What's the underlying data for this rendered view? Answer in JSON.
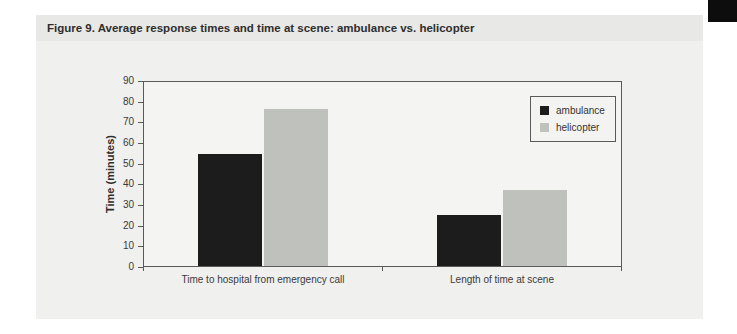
{
  "figure_title": "Figure 9. Average response times and time at scene: ambulance vs. helicopter",
  "decorations": {
    "corner_block_color": "#0d0d0d",
    "title_band_color": "#e8e8e6",
    "panel_color": "#f0f0ee",
    "plot_background_color": "#f4f4f2",
    "axis_line_color": "#5a5a5a"
  },
  "chart_data": {
    "type": "bar",
    "categories": [
      "Time to hospital from emergency call",
      "Length of time at scene"
    ],
    "series": [
      {
        "name": "ambulance",
        "color": "#1c1c1c",
        "values": [
          55,
          25
        ]
      },
      {
        "name": "helicopter",
        "color": "#bfc1bd",
        "values": [
          77,
          37
        ]
      }
    ],
    "title": "Figure 9. Average response times and time at scene: ambulance vs. helicopter",
    "xlabel": "",
    "ylabel": "Time (minutes)",
    "ylim": [
      0,
      90
    ],
    "ytick_step": 10,
    "grid": false,
    "legend_position": "top-right-inside"
  }
}
